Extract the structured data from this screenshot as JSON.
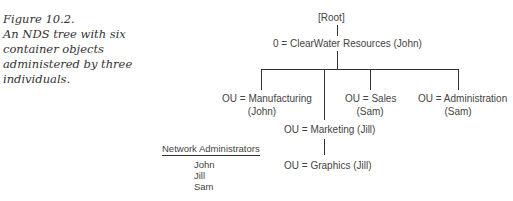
{
  "caption": {
    "figure": "Figure 10.2.",
    "lines": [
      "An NDS tree with six",
      "container objects",
      "administered by three",
      "individuals."
    ]
  },
  "tree": {
    "root": "[Root]",
    "organization": "0 = ClearWater Resources (John)",
    "ous": {
      "manufacturing": [
        "OU = Manufacturing",
        "(John)"
      ],
      "sales": [
        "OU = Sales",
        "(Sam)"
      ],
      "administration": [
        "OU = Administration",
        "(Sam)"
      ],
      "marketing": "OU = Marketing (Jill)",
      "graphics": "OU = Graphics (Jill)"
    }
  },
  "administrators": {
    "title": "Network Administrators",
    "names": [
      "John",
      "Jill",
      "Sam"
    ]
  }
}
